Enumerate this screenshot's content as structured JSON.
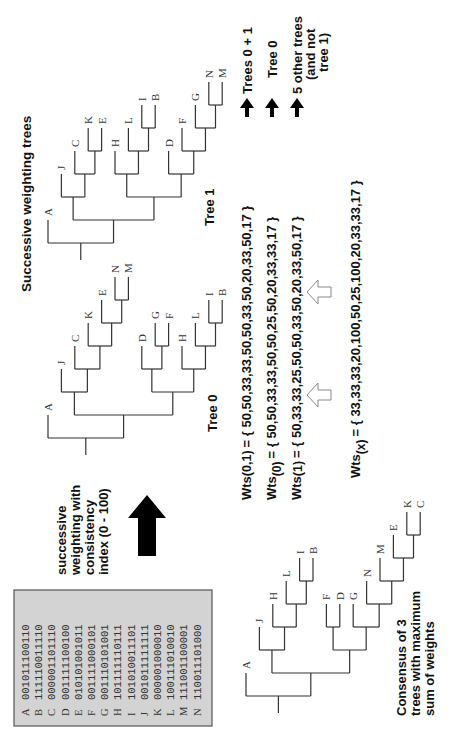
{
  "title": "Successive weighting trees",
  "data_matrix": {
    "rows": [
      {
        "taxon": "A",
        "chars": "001011100110"
      },
      {
        "taxon": "B",
        "chars": "111110011110"
      },
      {
        "taxon": "C",
        "chars": "000001101110"
      },
      {
        "taxon": "D",
        "chars": "001111100100"
      },
      {
        "taxon": "E",
        "chars": "010101001011"
      },
      {
        "taxon": "F",
        "chars": "001111000101"
      },
      {
        "taxon": "G",
        "chars": "001110101001"
      },
      {
        "taxon": "H",
        "chars": "101111110111"
      },
      {
        "taxon": "I",
        "chars": "101010011101"
      },
      {
        "taxon": "J",
        "chars": "001011111111"
      },
      {
        "taxon": "K",
        "chars": "000001000010"
      },
      {
        "taxon": "L",
        "chars": "100111010010"
      },
      {
        "taxon": "M",
        "chars": "111001100001"
      },
      {
        "taxon": "N",
        "chars": "110011101000"
      }
    ],
    "background": "#d3d3d3"
  },
  "process_note": {
    "lines": [
      "successive",
      "weighting with",
      "consistency",
      "index (0 - 100)"
    ]
  },
  "trees": [
    {
      "id": "tree0",
      "label": "Tree 0",
      "topology": [
        "A",
        [
          [
            "J",
            [
              "C",
              [
                "K",
                [
                  "E",
                  [
                    "N",
                    "M"
                  ]
                ]
              ]
            ]
          ],
          [
            [
              "D",
              [
                "G",
                "F"
              ]
            ],
            [
              "H",
              [
                "L",
                [
                  "I",
                  "B"
                ]
              ]
            ]
          ]
        ]
      ],
      "leaf_order": [
        "A",
        "J",
        "C",
        "K",
        "E",
        "N",
        "M",
        "D",
        "G",
        "F",
        "H",
        "L",
        "I",
        "B"
      ]
    },
    {
      "id": "tree1",
      "label": "Tree 1",
      "topology": [
        "A",
        [
          [
            "J",
            [
              "C",
              [
                "K",
                "E"
              ]
            ]
          ],
          [
            [
              "H",
              [
                "L",
                [
                  "I",
                  "B"
                ]
              ]
            ],
            [
              "D",
              [
                "F",
                [
                  "G",
                  [
                    "N",
                    "M"
                  ]
                ]
              ]
            ]
          ]
        ]
      ],
      "leaf_order": [
        "A",
        "J",
        "C",
        "K",
        "E",
        "H",
        "L",
        "I",
        "B",
        "D",
        "F",
        "G",
        "N",
        "M"
      ]
    },
    {
      "id": "consensus",
      "label": "Consensus of 3 trees with maximum sum of weights",
      "label_lines": [
        "Consensus of 3",
        "trees with maximum",
        "sum of weights"
      ],
      "topology": [
        "A",
        [
          [
            "J",
            [
              "H",
              [
                "L",
                [
                  "I",
                  "B"
                ]
              ]
            ]
          ],
          [
            [
              "F",
              "D"
            ],
            [
              "G",
              [
                "N",
                [
                  "M",
                  [
                    "E",
                    [
                      "K",
                      "C"
                    ]
                  ]
                ]
              ]
            ]
          ]
        ]
      ],
      "leaf_order": [
        "A",
        "J",
        "H",
        "L",
        "I",
        "B",
        "F",
        "D",
        "G",
        "N",
        "M",
        "E",
        "K",
        "C"
      ]
    }
  ],
  "weights": [
    {
      "label": "Wts",
      "subscript": "(0,1)",
      "values_text": "= { 50,50,33,33,50,50,33,50,20,33,50,17 }",
      "values": [
        50,
        50,
        33,
        33,
        50,
        50,
        33,
        50,
        20,
        33,
        50,
        17
      ],
      "result_lines": [
        "Trees 0 + 1"
      ]
    },
    {
      "label": "Wts",
      "subscript": "(0)",
      "values_text": "= { 50,50,33,33,50,50,25,50,20,33,33,17 }",
      "values": [
        50,
        50,
        33,
        33,
        50,
        50,
        25,
        50,
        20,
        33,
        33,
        17
      ],
      "result_lines": [
        "Tree 0"
      ]
    },
    {
      "label": "Wts",
      "subscript": "(1)",
      "values_text": "= { 50,33,33,25,50,50,33,50,20,33,50,17 }",
      "values": [
        50,
        33,
        33,
        25,
        50,
        50,
        33,
        50,
        20,
        33,
        50,
        17
      ],
      "result_lines": [
        "5 other trees",
        "(and not",
        "tree 1)"
      ]
    },
    {
      "label": "Wts",
      "subscript": "(x)",
      "values_text": "= { 33,33,33,20,100,50,25,100,20,33,33,17 }",
      "values": [
        33,
        33,
        33,
        20,
        100,
        50,
        25,
        100,
        20,
        33,
        33,
        17
      ],
      "result_lines": []
    }
  ],
  "colors": {
    "line": "#333333",
    "text": "#111111",
    "arrow_fill": "#000000",
    "open_arrow_stroke": "#888888"
  }
}
